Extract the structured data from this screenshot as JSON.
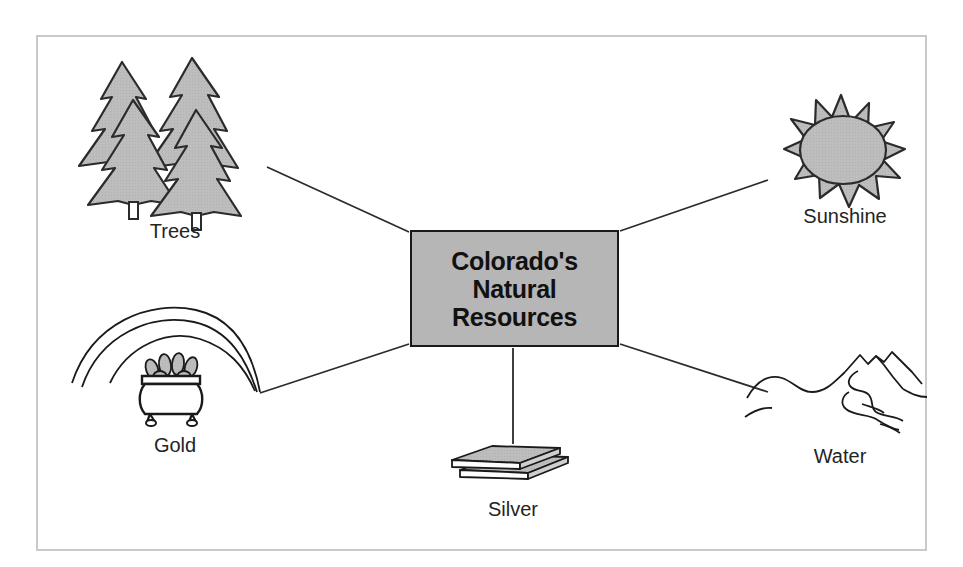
{
  "diagram": {
    "type": "concept-map",
    "center": {
      "lines": [
        "Colorado's",
        "Natural",
        "Resources"
      ],
      "fill_color": "#b6b6b6",
      "border_color": "#1a1a1a",
      "text_color": "#111111"
    },
    "frame": {
      "border_color": "#c9c9c9",
      "background_color": "#ffffff"
    },
    "connector_color": "#2b2b2b",
    "nodes": [
      {
        "id": "trees",
        "label": "Trees",
        "icon": "pine-trees-icon",
        "position": "top-left",
        "fill_color": "#bdbdbd",
        "outline_color": "#2b2b2b"
      },
      {
        "id": "sunshine",
        "label": "Sunshine",
        "icon": "sun-icon",
        "position": "top-right",
        "fill_color": "#bdbdbd",
        "outline_color": "#2b2b2b"
      },
      {
        "id": "gold",
        "label": "Gold",
        "icon": "pot-of-gold-rainbow-icon",
        "position": "bottom-left",
        "fill_color": "#b0b0b0",
        "outline_color": "#1a1a1a"
      },
      {
        "id": "silver",
        "label": "Silver",
        "icon": "silver-bars-icon",
        "position": "bottom-center",
        "fill_color": "#b5b5b5",
        "outline_color": "#1a1a1a"
      },
      {
        "id": "water",
        "label": "Water",
        "icon": "mountains-river-icon",
        "position": "bottom-right",
        "fill_color": "none",
        "outline_color": "#1a1a1a"
      }
    ]
  }
}
